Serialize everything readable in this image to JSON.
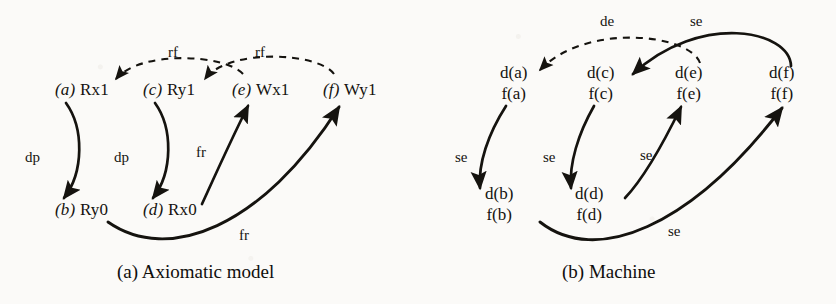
{
  "figure": {
    "background_color": "#fbfaf8",
    "ink_color": "#15130f"
  },
  "panels": [
    {
      "id": "axiomatic-model",
      "caption": "(a) Axiomatic model",
      "nodes": [
        {
          "id": "a",
          "tag": "(a)",
          "event": "Rx1",
          "row": "top",
          "x": 55,
          "y": 89
        },
        {
          "id": "c",
          "tag": "(c)",
          "event": "Ry1",
          "row": "top",
          "x": 143,
          "y": 89
        },
        {
          "id": "e",
          "tag": "(e)",
          "event": "Wx1",
          "row": "top",
          "x": 232,
          "y": 89
        },
        {
          "id": "f",
          "tag": "(f)",
          "event": "Wy1",
          "row": "top",
          "x": 323,
          "y": 89
        },
        {
          "id": "b",
          "tag": "(b)",
          "event": "Ry0",
          "row": "bottom",
          "x": 55,
          "y": 209
        },
        {
          "id": "d",
          "tag": "(d)",
          "event": "Rx0",
          "row": "bottom",
          "x": 143,
          "y": 209
        }
      ],
      "edges": [
        {
          "label": "rf",
          "from": "e",
          "to": "a",
          "style": "dashed",
          "label_x": 168,
          "label_y": 45
        },
        {
          "label": "rf",
          "from": "f",
          "to": "c",
          "style": "dashed",
          "label_x": 255,
          "label_y": 45
        },
        {
          "label": "dp",
          "from": "a",
          "to": "b",
          "style": "solid",
          "label_x": 25,
          "label_y": 150
        },
        {
          "label": "dp",
          "from": "c",
          "to": "d",
          "style": "solid",
          "label_x": 114,
          "label_y": 150
        },
        {
          "label": "fr",
          "from": "d",
          "to": "e",
          "style": "solid",
          "label_x": 196,
          "label_y": 145
        },
        {
          "label": "fr",
          "from": "b",
          "to": "f",
          "style": "solid",
          "label_x": 239,
          "label_y": 228
        }
      ]
    },
    {
      "id": "machine",
      "caption": "(b) Machine",
      "nodes": [
        {
          "id": "a",
          "d": "d(a)",
          "f": "f(a)",
          "row": "top",
          "x": 517,
          "y": 70
        },
        {
          "id": "c",
          "d": "d(c)",
          "f": "f(c)",
          "row": "top",
          "x": 604,
          "y": 70
        },
        {
          "id": "e",
          "d": "d(e)",
          "f": "f(e)",
          "row": "top",
          "x": 692,
          "y": 70
        },
        {
          "id": "f",
          "d": "d(f)",
          "f": "f(f)",
          "row": "top",
          "x": 786,
          "y": 70
        },
        {
          "id": "b",
          "d": "d(b)",
          "f": "f(b)",
          "row": "bottom",
          "x": 487,
          "y": 191
        },
        {
          "id": "d",
          "d": "d(d)",
          "f": "f(d)",
          "row": "bottom",
          "x": 577,
          "y": 191
        }
      ],
      "edges": [
        {
          "label": "de",
          "from": "d(e)",
          "to": "d(a)",
          "style": "dashed",
          "label_x": 600,
          "label_y": 14
        },
        {
          "label": "se",
          "from": "d(f)",
          "to": "d(c)",
          "style": "solid",
          "label_x": 690,
          "label_y": 14
        },
        {
          "label": "se",
          "from": "f(a)",
          "to": "d(b)",
          "style": "solid",
          "label_x": 455,
          "label_y": 150
        },
        {
          "label": "se",
          "from": "f(c)",
          "to": "d(d)",
          "style": "solid",
          "label_x": 543,
          "label_y": 150
        },
        {
          "label": "se",
          "from": "f(d)",
          "to": "f(e)",
          "style": "solid",
          "label_x": 640,
          "label_y": 148
        },
        {
          "label": "se",
          "from": "f(b)",
          "to": "f(f)",
          "style": "solid",
          "label_x": 668,
          "label_y": 224
        }
      ]
    }
  ]
}
